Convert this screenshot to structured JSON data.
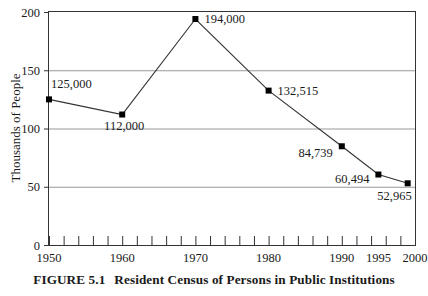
{
  "figure": {
    "caption_label": "FIGURE  5.1",
    "caption_text": "Resident Census of Persons in Public Institutions"
  },
  "chart_data": {
    "type": "line",
    "title": "",
    "subtitle": "",
    "xlabel": "",
    "ylabel": "Thousands of People",
    "xlim": [
      1950,
      2000
    ],
    "ylim": [
      0,
      200
    ],
    "grid": "horizontal",
    "legend": "none",
    "marker": "filled-square",
    "line_color": "#333333",
    "marker_color": "#000000",
    "grid_color": "#999999",
    "axis_color": "#333333",
    "x": [
      1950,
      1960,
      1970,
      1980,
      1990,
      1995,
      1999
    ],
    "values": [
      125,
      112,
      194,
      132.515,
      84.739,
      60.494,
      52.965
    ],
    "point_labels": [
      "125,000",
      "112,000",
      "194,000",
      "132,515",
      "84,739",
      "60,494",
      "52,965"
    ],
    "xticks": [
      1950,
      1960,
      1970,
      1980,
      1990,
      1995,
      2000
    ],
    "xtick_labels": [
      "1950",
      "1960",
      "1970",
      "1980",
      "1990",
      "1995",
      "2000"
    ],
    "x_minor_tick_interval": 2,
    "yticks": [
      0,
      50,
      100,
      150,
      200
    ],
    "ytick_labels": [
      "0",
      "50",
      "100",
      "150",
      "200"
    ]
  }
}
